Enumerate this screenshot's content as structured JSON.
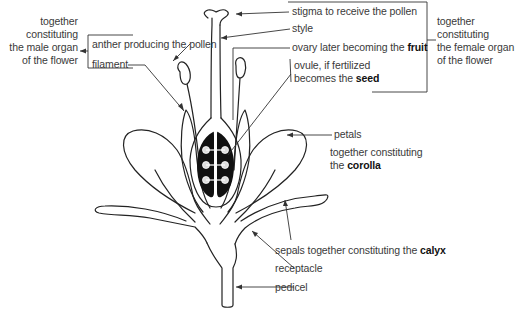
{
  "diagram": {
    "male_group": {
      "lines": [
        "together",
        "constituting",
        "the male organ",
        "of the flower"
      ]
    },
    "female_group": {
      "lines": [
        "together",
        "constituting",
        "the female organ",
        "of the flower"
      ]
    },
    "labels": {
      "anther": "anther producing the pollen",
      "filament": "filament",
      "stigma": "stigma to receive the pollen",
      "style": "style",
      "ovary_prefix": "ovary later becoming the ",
      "ovary_bold": "fruit",
      "ovule_line1": "ovule, if fertilized",
      "ovule_prefix": "becomes the ",
      "ovule_bold": "seed",
      "petals": "petals",
      "corolla_line1": "together constituting",
      "corolla_prefix": "the ",
      "corolla_bold": "corolla",
      "sepals_prefix": "sepals together constituting the ",
      "sepals_bold": "calyx",
      "receptacle": "receptacle",
      "pedicel": "pedicel"
    },
    "colors": {
      "line": "#222222",
      "text": "#3a3a3a",
      "ovary_fill": "#111111"
    }
  }
}
